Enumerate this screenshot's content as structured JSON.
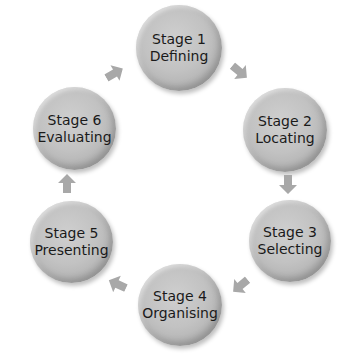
{
  "diagram": {
    "type": "cycle",
    "colors": {
      "circle": "#c4c4c4",
      "arrow": "#a8a8a8",
      "text": "#1a1a1a",
      "background": "#ffffff"
    },
    "stages": [
      {
        "number": "Stage 1",
        "label": "Defining"
      },
      {
        "number": "Stage 2",
        "label": "Locating"
      },
      {
        "number": "Stage 3",
        "label": "Selecting"
      },
      {
        "number": "Stage 4",
        "label": "Organising"
      },
      {
        "number": "Stage 5",
        "label": "Presenting"
      },
      {
        "number": "Stage 6",
        "label": "Evaluating"
      }
    ],
    "arrows": [
      {
        "from": "Stage 1",
        "to": "Stage 2",
        "direction": "down-right"
      },
      {
        "from": "Stage 2",
        "to": "Stage 3",
        "direction": "down"
      },
      {
        "from": "Stage 3",
        "to": "Stage 4",
        "direction": "down-left"
      },
      {
        "from": "Stage 4",
        "to": "Stage 5",
        "direction": "up-left"
      },
      {
        "from": "Stage 5",
        "to": "Stage 6",
        "direction": "up"
      },
      {
        "from": "Stage 6",
        "to": "Stage 1",
        "direction": "up-right"
      }
    ]
  }
}
